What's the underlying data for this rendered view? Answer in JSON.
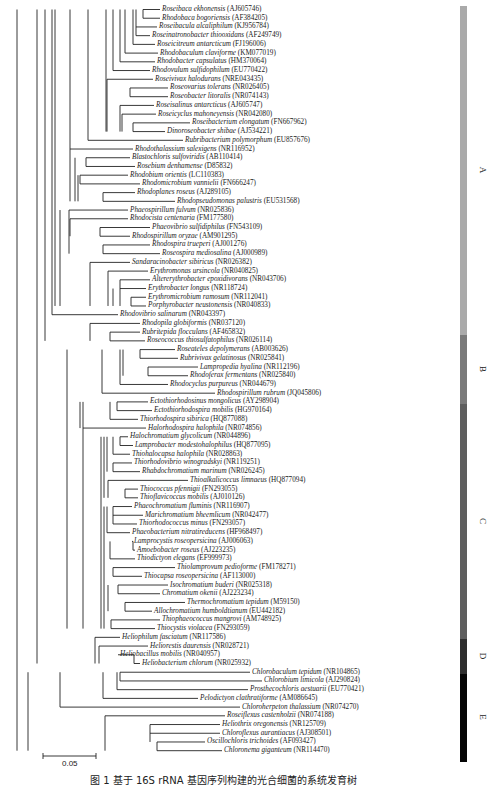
{
  "tree": {
    "leaves": [
      {
        "sp": "Roseibaca ekhonensis",
        "acc": "(AJ605746)"
      },
      {
        "sp": "Rhodobaca bogoriensis",
        "acc": "(AF384205)"
      },
      {
        "sp": "Roseibacula alcaliphilum",
        "acc": "(KJ956784)"
      },
      {
        "sp": "Roseinatronobacter thiooxidans",
        "acc": "(AF249749)"
      },
      {
        "sp": "Roseicitreum antarcticum",
        "acc": "(FJ196006)"
      },
      {
        "sp": "Rhodobaculum claviforme",
        "acc": "(KM077019)"
      },
      {
        "sp": "Rhodobacter capsulatus",
        "acc": "(HM370064)"
      },
      {
        "sp": "Rhodovulum sulfidophilum",
        "acc": "(EU770422)"
      },
      {
        "sp": "Roseivivax halodurans",
        "acc": "(NRE043435)"
      },
      {
        "sp": "Roseovarius tolerans",
        "acc": "(NR026405)"
      },
      {
        "sp": "Roseobacter litoralis",
        "acc": "(NR074143)"
      },
      {
        "sp": "Roseisalinus antarcticus",
        "acc": "(AJ605747)"
      },
      {
        "sp": "Roseicyclus mahoneyensis",
        "acc": "(NR042080)"
      },
      {
        "sp": "Roseibacterium elongatum",
        "acc": "(FN667962)"
      },
      {
        "sp": "Dinoroseobacter shibae",
        "acc": "(AJ534221)"
      },
      {
        "sp": "Rubribacterium polymorphum",
        "acc": "(EU857676)"
      },
      {
        "sp": "Rhodothalassium salexigens",
        "acc": "(NR116952)"
      },
      {
        "sp": "Blastochloris sulfoviridis",
        "acc": "(AB110414)"
      },
      {
        "sp": "Rosebium denhamense",
        "acc": "(D85832)"
      },
      {
        "sp": "Rhodobium orientis",
        "acc": "(LC110383)"
      },
      {
        "sp": "Rhodomicrobium vannielii",
        "acc": "(FN666247)"
      },
      {
        "sp": "Rhodoplanes roseus",
        "acc": "(AJ289105)"
      },
      {
        "sp": "Rhodopseudomonas palustris",
        "acc": "(EU531568)"
      },
      {
        "sp": "Phaeospirillum fulvum",
        "acc": "(NR025836)"
      },
      {
        "sp": "Rhodocista centenaria",
        "acc": "(FM177580)"
      },
      {
        "sp": "Phaeovibrio sulfidiphilus",
        "acc": "(FN543109)"
      },
      {
        "sp": "Rhodospirillum oryzae",
        "acc": "(AM901295)"
      },
      {
        "sp": "Rhodospira trueperi",
        "acc": "(AJ001276)"
      },
      {
        "sp": "Roseospira mediosalina",
        "acc": "(AJ000989)"
      },
      {
        "sp": "Sandaracinobacter sibiricus",
        "acc": "(NR026382)"
      },
      {
        "sp": "Erythromonas ursincola",
        "acc": "(NR040825)"
      },
      {
        "sp": "Altererythrobacter epoxidivorans",
        "acc": "(NR043706)"
      },
      {
        "sp": "Erythrobacter longus",
        "acc": "(NR118724)"
      },
      {
        "sp": "Erythromicrobium ramosum",
        "acc": "(NR112041)"
      },
      {
        "sp": "Porphyrobacter neustonensis",
        "acc": "(NR040833)"
      },
      {
        "sp": "Rhodovibrio salinarum",
        "acc": "(NR043397)"
      },
      {
        "sp": "Rhodopila globiformis",
        "acc": "(NR037120)"
      },
      {
        "sp": "Rubritepida flocculans",
        "acc": "(AF465832)"
      },
      {
        "sp": "Roseococcus thiosulfatophilus",
        "acc": "(NR026114)"
      },
      {
        "sp": "Roseateles depolymerans",
        "acc": "(AB003626)"
      },
      {
        "sp": "Rubrivivax gelatinosus",
        "acc": "(NR025841)"
      },
      {
        "sp": "Lampropedia hyalina",
        "acc": "(NR112196)"
      },
      {
        "sp": "Rhodoferax fermentans",
        "acc": "(NR025840)"
      },
      {
        "sp": "Rhodocyclus purpureus",
        "acc": "(NR044679)"
      },
      {
        "sp": "Rhodospirillum rubrum",
        "acc": "(JQ045806)"
      },
      {
        "sp": "Ectothiorhodosinus mongolicus",
        "acc": "(AY298904)"
      },
      {
        "sp": "Ectothiorhodospira mobilis",
        "acc": "(HG970164)"
      },
      {
        "sp": "Thiorhodospira sibirica",
        "acc": "(HQ877088)"
      },
      {
        "sp": "Halorhodospira halophila",
        "acc": "(NR074856)"
      },
      {
        "sp": "Halochromatium glycolicum",
        "acc": "(NR044896)"
      },
      {
        "sp": "Lamprobacter modestohalophilus",
        "acc": "(HQ877095)"
      },
      {
        "sp": "Thiohalocapsa halophila",
        "acc": "(NR028863)"
      },
      {
        "sp": "Thiorhodovibrio winogradskyi",
        "acc": "(NR119251)"
      },
      {
        "sp": "Rhabdochromatium marinum",
        "acc": "(NR026245)"
      },
      {
        "sp": "Thioalkalicoccus limnaeus",
        "acc": "(HQ877094)"
      },
      {
        "sp": "Thiococcus pfennigii",
        "acc": "(FN293055)"
      },
      {
        "sp": "Thioflavicoccus mobilis",
        "acc": "(AJ010126)"
      },
      {
        "sp": "Phaeochromatium fluminis",
        "acc": "(NR116907)"
      },
      {
        "sp": "Marichromatium bheemlicum",
        "acc": "(NR042477)"
      },
      {
        "sp": "Thiorhodococcus minus",
        "acc": "(FN293057)"
      },
      {
        "sp": "Phaeobacterium nitratireducens",
        "acc": "(HF968497)"
      },
      {
        "sp": "Lamprocystis roseopersicina",
        "acc": "(AJ006063)"
      },
      {
        "sp": "Amoebobacter roseus",
        "acc": "(AJ223235)"
      },
      {
        "sp": "Thiodictyon elegans",
        "acc": "(EF999973)"
      },
      {
        "sp": "Thiolamprovum pedioforme",
        "acc": "(FM178271)"
      },
      {
        "sp": "Thiocapsa roseopersicina",
        "acc": "(AF113000)"
      },
      {
        "sp": "Isochromatium buderi",
        "acc": "(NR025318)"
      },
      {
        "sp": "Chromatium okenii",
        "acc": "(AJ223234)"
      },
      {
        "sp": "Thermochromatium tepidum",
        "acc": "(M59150)"
      },
      {
        "sp": "Allochromatium humboldtianum",
        "acc": "(EU442182)"
      },
      {
        "sp": "Thiophaeococcus mangrovi",
        "acc": "(AM748925)"
      },
      {
        "sp": "Thiocystis violacea",
        "acc": "(FN293059)"
      },
      {
        "sp": "Heliophilum fasciatum",
        "acc": "(NR117586)"
      },
      {
        "sp": "Heliorestis daurensis",
        "acc": "(NR028721)"
      },
      {
        "sp": "Heliobacillus mobilis",
        "acc": "(NR040957)"
      },
      {
        "sp": "Heliobacterium chlorum",
        "acc": "(NR025932)"
      },
      {
        "sp": "Chlorobaculum tepidum",
        "acc": "(NR104865)"
      },
      {
        "sp": "Chlorobium limicola",
        "acc": "(AJ290824)"
      },
      {
        "sp": "Prosthecochloris aestuarii",
        "acc": "(EU770421)"
      },
      {
        "sp": "Pelodictyon clathratiforme",
        "acc": "(AM086645)"
      },
      {
        "sp": "Chloroherpeton thalassium",
        "acc": "(NR074270)"
      },
      {
        "sp": "Roseiflexus castenholzii",
        "acc": "(NR074188)"
      },
      {
        "sp": "Heliothrix oregonensis",
        "acc": "(NR125709)"
      },
      {
        "sp": "Chloroflexus aurantiacus",
        "acc": "(AJ308501)"
      },
      {
        "sp": "Oscillochloris trichoides",
        "acc": "(AF093427)"
      },
      {
        "sp": "Chloronema giganteum",
        "acc": "(NR114470)"
      }
    ],
    "leaf_x": [
      160,
      160,
      157,
      150,
      155,
      158,
      155,
      150,
      153,
      168,
      168,
      154,
      156,
      190,
      165,
      183,
      133,
      130,
      135,
      128,
      140,
      135,
      175,
      128,
      128,
      150,
      130,
      150,
      160,
      130,
      148,
      150,
      146,
      146,
      146,
      118,
      140,
      140,
      145,
      175,
      178,
      198,
      188,
      168,
      215,
      148,
      152,
      138,
      146,
      128,
      133,
      130,
      132,
      140,
      188,
      138,
      138,
      132,
      143,
      137,
      130,
      132,
      135,
      135,
      175,
      142,
      168,
      160,
      185,
      152,
      160,
      155,
      120,
      148,
      118,
      140,
      250,
      262,
      248,
      198,
      240,
      225,
      220,
      220,
      205,
      222
    ],
    "clades": [
      {
        "label": "A",
        "color": "#aaaaaa",
        "top": 6,
        "bottom": 335
      },
      {
        "label": "B",
        "color": "#7a7a7a",
        "top": 335,
        "bottom": 404
      },
      {
        "label": "C",
        "color": "#5e5e5e",
        "top": 404,
        "bottom": 639
      },
      {
        "label": "D",
        "color": "#2e2e2e",
        "top": 639,
        "bottom": 674
      },
      {
        "label": "E",
        "color": "#050505",
        "top": 674,
        "bottom": 762
      }
    ]
  },
  "scale_bar": {
    "label": "0.05"
  },
  "caption": "图 1   基于 16S rRNA 基因序列构建的光合细菌的系统发育树"
}
